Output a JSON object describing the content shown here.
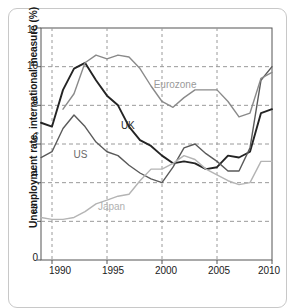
{
  "chart_data": {
    "type": "line",
    "title": "",
    "subtitle": "",
    "xlabel": "",
    "ylabel": "Unemployment rate, international measure (%)",
    "xlim": [
      1989,
      2010
    ],
    "ylim": [
      0,
      12
    ],
    "xticks": [
      "1990",
      "1995",
      "2000",
      "2005",
      "2010"
    ],
    "xtick_values": [
      1990,
      1995,
      2000,
      2005,
      2010
    ],
    "yticks": [
      "0",
      "2",
      "4",
      "6",
      "8",
      "10",
      "12"
    ],
    "ytick_values": [
      0,
      2,
      4,
      6,
      8,
      10,
      12
    ],
    "grid": "dashed gridlines on both axes",
    "legend_position": "inline annotations on curves",
    "x": [
      1989,
      1990,
      1991,
      1992,
      1993,
      1994,
      1995,
      1996,
      1997,
      1998,
      1999,
      2000,
      2001,
      2002,
      2003,
      2004,
      2005,
      2006,
      2007,
      2008,
      2009,
      2010
    ],
    "series": [
      {
        "name": "UK",
        "color": "#242424",
        "values": [
          7.1,
          6.9,
          8.8,
          9.9,
          10.2,
          9.3,
          8.5,
          8.0,
          6.9,
          6.2,
          5.9,
          5.4,
          5.0,
          5.1,
          5.0,
          4.7,
          4.8,
          5.4,
          5.3,
          5.6,
          7.6,
          7.8
        ]
      },
      {
        "name": "US",
        "color": "#5a5a5a",
        "values": [
          5.3,
          5.6,
          6.8,
          7.5,
          6.9,
          6.1,
          5.6,
          5.4,
          4.9,
          4.5,
          4.2,
          4.0,
          4.8,
          5.8,
          6.0,
          5.5,
          5.1,
          4.6,
          4.6,
          5.8,
          9.3,
          10.0
        ]
      },
      {
        "name": "Eurozone",
        "color": "#8a8a8a",
        "values": [
          null,
          null,
          7.8,
          8.6,
          10.2,
          10.6,
          10.4,
          10.6,
          10.5,
          9.9,
          9.0,
          8.2,
          7.9,
          8.4,
          8.8,
          8.8,
          8.8,
          8.2,
          7.4,
          7.6,
          9.4,
          9.7
        ]
      },
      {
        "name": "Japan",
        "color": "#b4b4b4",
        "values": [
          2.2,
          2.1,
          2.1,
          2.2,
          2.5,
          2.9,
          3.1,
          3.3,
          3.4,
          4.1,
          4.7,
          4.7,
          5.0,
          5.4,
          5.2,
          4.7,
          4.4,
          4.1,
          3.9,
          4.0,
          5.1,
          5.1
        ]
      }
    ],
    "annotations": [
      {
        "text": "Eurozone",
        "x": 2001.2,
        "y": 9.05
      },
      {
        "text": "UK",
        "x": 1996.9,
        "y": 6.95
      },
      {
        "text": "US",
        "x": 1992.6,
        "y": 5.45
      },
      {
        "text": "Japan",
        "x": 1995.4,
        "y": 2.75
      }
    ],
    "colors": {
      "uk": "#242424",
      "us": "#5a5a5a",
      "eurozone": "#8a8a8a",
      "japan": "#b4b4b4",
      "grid": "#9a9a9a",
      "axis": "#555555",
      "card_border": "#c8c8c8",
      "background": "#ffffff"
    }
  }
}
